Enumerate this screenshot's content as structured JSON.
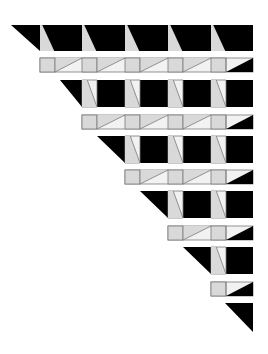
{
  "figure": {
    "colors": {
      "background": "#ffffff",
      "black": "#000000",
      "light": "#d9d9d9",
      "lighter": "#f2f2f2",
      "stroke": "#7a7a7a"
    },
    "grid": {
      "right_edge": 253,
      "columns": [
        40,
        82,
        125,
        168,
        211
      ],
      "strip_width": 15
    },
    "dark_rows": [
      {
        "top": 25,
        "bottom": 51,
        "start_top": 11,
        "start_bottom": 40
      },
      {
        "top": 80,
        "bottom": 107,
        "start_top": 60,
        "start_bottom": 82
      },
      {
        "top": 136,
        "bottom": 163,
        "start_top": 97,
        "start_bottom": 125
      },
      {
        "top": 191,
        "bottom": 218,
        "start_top": 140,
        "start_bottom": 168
      },
      {
        "top": 247,
        "bottom": 274,
        "start_top": 183,
        "start_bottom": 211
      },
      {
        "top": 303,
        "bottom": 332,
        "start_top": 225,
        "start_bottom": 253
      }
    ],
    "light_rows": [
      {
        "top": 58,
        "bottom": 72,
        "start": 40
      },
      {
        "top": 115,
        "bottom": 129,
        "start": 82
      },
      {
        "top": 170,
        "bottom": 184,
        "start": 125
      },
      {
        "top": 226,
        "bottom": 240,
        "start": 168
      },
      {
        "top": 282,
        "bottom": 296,
        "start": 211
      }
    ]
  }
}
